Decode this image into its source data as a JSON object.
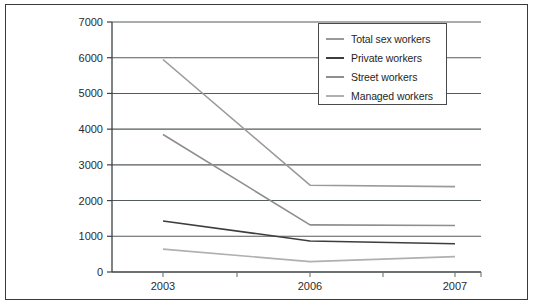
{
  "figure": {
    "border_color": "#3a3a3a",
    "background": "#ffffff"
  },
  "chart_data": {
    "type": "line",
    "title": "",
    "subtitle": "",
    "xlabel": "",
    "ylabel": "",
    "categories": [
      "2003",
      "2006",
      "2007"
    ],
    "x_tick_labels": [
      "2003",
      "2006",
      "2007"
    ],
    "y_tick_labels": [
      "0",
      "1000",
      "2000",
      "3000",
      "4000",
      "5000",
      "6000",
      "7000"
    ],
    "y_ticks": [
      0,
      1000,
      2000,
      3000,
      4000,
      5000,
      6000,
      7000
    ],
    "ylim": [
      0,
      7000
    ],
    "grid": "horizontal",
    "legend_position": "top-right-inside",
    "series": [
      {
        "name": "Total sex workers",
        "color": "#9a9a9a",
        "values": [
          5950,
          2430,
          2390
        ]
      },
      {
        "name": "Private workers",
        "color": "#3d3d3d",
        "values": [
          1430,
          870,
          790
        ]
      },
      {
        "name": "Street workers",
        "color": "#8e8e8e",
        "values": [
          3850,
          1320,
          1300
        ]
      },
      {
        "name": "Managed workers",
        "color": "#b0b0b0",
        "values": [
          640,
          290,
          430
        ]
      }
    ]
  },
  "legend": {
    "items": [
      {
        "label": "Total sex workers",
        "color": "#9a9a9a"
      },
      {
        "label": "Private workers",
        "color": "#3d3d3d"
      },
      {
        "label": "Street workers",
        "color": "#8e8e8e"
      },
      {
        "label": "Managed workers",
        "color": "#b0b0b0"
      }
    ]
  }
}
